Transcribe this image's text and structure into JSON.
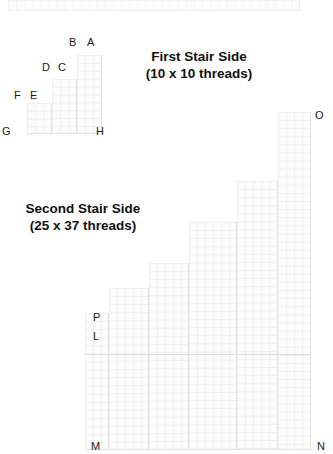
{
  "page": {
    "background": "#ffffff",
    "width": 333,
    "height": 454,
    "grid_line_color": "#e2e2e2",
    "label_color": "#1a1a1a",
    "caption_color": "#111111"
  },
  "top_strip": {
    "name": "top-thread-strip",
    "cells_across": 36,
    "cells_down": 1
  },
  "first_stair": {
    "caption": {
      "line1": "First Stair Side",
      "line2": "(10 x 10 threads)"
    },
    "threads_wide": 10,
    "threads_tall": 10,
    "columns": [
      {
        "cells_wide": 3,
        "cells_tall": 4
      },
      {
        "cells_wide": 3,
        "cells_tall": 7
      },
      {
        "cells_wide": 4,
        "cells_tall": 10
      }
    ],
    "labels": [
      {
        "id": "A",
        "text": "A",
        "corner": "top-right"
      },
      {
        "id": "B",
        "text": "B",
        "corner": "top-left-of-tall-column"
      },
      {
        "id": "C",
        "text": "C",
        "corner": "top-right-of-mid-column"
      },
      {
        "id": "D",
        "text": "D",
        "corner": "top-left-of-mid-column"
      },
      {
        "id": "E",
        "text": "E",
        "corner": "top-right-of-low-column"
      },
      {
        "id": "F",
        "text": "F",
        "corner": "top-left-of-low-column"
      },
      {
        "id": "G",
        "text": "G",
        "corner": "bottom-left"
      },
      {
        "id": "H",
        "text": "H",
        "corner": "bottom-right"
      }
    ]
  },
  "second_stair": {
    "caption": {
      "line1": "Second Stair Side",
      "line2": "(25 x 37 threads)"
    },
    "threads_wide": 37,
    "threads_tall": 25,
    "steps": [
      {
        "cells_wide": 3,
        "cells_tall": 8
      },
      {
        "cells_wide": 5,
        "cells_tall": 12
      },
      {
        "cells_wide": 5,
        "cells_tall": 16
      },
      {
        "cells_wide": 6,
        "cells_tall": 21
      },
      {
        "cells_wide": 5,
        "cells_tall": 27
      },
      {
        "cells_wide": 5,
        "cells_tall": 33
      },
      {
        "cells_wide": 5,
        "cells_tall": 38
      }
    ],
    "labels": [
      {
        "id": "O",
        "text": "O",
        "corner": "top-right"
      },
      {
        "id": "P",
        "text": "P",
        "corner": "left-upper"
      },
      {
        "id": "L",
        "text": "L",
        "corner": "left-upper-second"
      },
      {
        "id": "M",
        "text": "M",
        "corner": "bottom-left"
      },
      {
        "id": "N",
        "text": "N",
        "corner": "bottom-right"
      }
    ]
  }
}
